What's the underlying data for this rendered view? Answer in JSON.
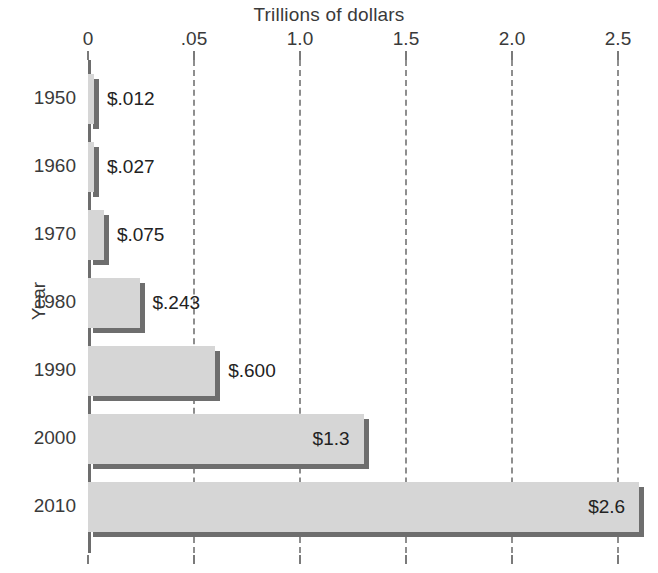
{
  "chart_data": {
    "type": "bar",
    "orientation": "horizontal",
    "title": "Trillions of dollars",
    "xlabel": "Trillions of dollars",
    "ylabel": "Year",
    "categories": [
      "1950",
      "1960",
      "1970",
      "1980",
      "1990",
      "2000",
      "2010"
    ],
    "values": [
      0.012,
      0.027,
      0.075,
      0.243,
      0.6,
      1.3,
      2.6
    ],
    "value_labels": [
      "$.012",
      "$.027",
      "$.075",
      "$.243",
      "$.600",
      "$1.3",
      "$2.6"
    ],
    "label_placement": [
      "outside",
      "outside",
      "outside",
      "outside",
      "outside",
      "inside",
      "inside"
    ],
    "xticks": [
      0,
      0.5,
      1.0,
      1.5,
      2.0,
      2.5
    ],
    "xtick_labels": [
      "0",
      ".05",
      "1.0",
      "1.5",
      "2.0",
      "2.5"
    ],
    "xlim": [
      0,
      2.7
    ],
    "grid": "vertical-dashed",
    "legend": "none",
    "colors": {
      "bar_fill": "#d6d6d6",
      "bar_shadow": "#6e6e6e",
      "axis": "#6d6d6d",
      "grid": "#8e8e8e",
      "text": "#3a3a3a"
    }
  },
  "axes": {
    "title": "Trillions of dollars",
    "y_title": "Year"
  }
}
